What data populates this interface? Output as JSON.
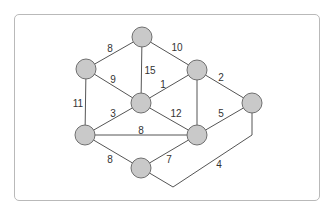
{
  "diagram": {
    "type": "weighted-undirected-graph",
    "node_style": {
      "fill": "#c9c9c9",
      "stroke": "#6f6f6f",
      "radius": 10
    },
    "nodes": [
      {
        "id": "top",
        "x": 142,
        "y": 37
      },
      {
        "id": "upper-left",
        "x": 86,
        "y": 69
      },
      {
        "id": "upper-right",
        "x": 197,
        "y": 70
      },
      {
        "id": "center",
        "x": 141,
        "y": 103
      },
      {
        "id": "far-right",
        "x": 252,
        "y": 103
      },
      {
        "id": "lower-left",
        "x": 85,
        "y": 135
      },
      {
        "id": "lower-right",
        "x": 197,
        "y": 135
      },
      {
        "id": "bottom",
        "x": 141,
        "y": 168
      }
    ],
    "edges": [
      {
        "from": "top",
        "to": "upper-left",
        "weight": "8"
      },
      {
        "from": "top",
        "to": "upper-right",
        "weight": "10"
      },
      {
        "from": "top",
        "to": "center",
        "weight": "15"
      },
      {
        "from": "upper-left",
        "to": "center",
        "weight": "9"
      },
      {
        "from": "upper-left",
        "to": "lower-left",
        "weight": "11"
      },
      {
        "from": "upper-right",
        "to": "center",
        "weight": "1"
      },
      {
        "from": "upper-right",
        "to": "far-right",
        "weight": "2"
      },
      {
        "from": "upper-right",
        "to": "lower-right",
        "weight": ""
      },
      {
        "from": "center",
        "to": "lower-left",
        "weight": "3"
      },
      {
        "from": "center",
        "to": "lower-right",
        "weight": "12"
      },
      {
        "from": "far-right",
        "to": "lower-right",
        "weight": "5"
      },
      {
        "from": "lower-left",
        "to": "lower-right",
        "weight": "8"
      },
      {
        "from": "lower-left",
        "to": "bottom",
        "weight": "8"
      },
      {
        "from": "lower-right",
        "to": "bottom",
        "weight": "7"
      },
      {
        "from": "bottom",
        "to": "far-right",
        "weight": "4",
        "routed": true
      }
    ],
    "labels": {
      "e_top_ul": "8",
      "e_top_ur": "10",
      "e_top_c": "15",
      "e_ul_c": "9",
      "e_ul_ll": "11",
      "e_ur_c": "1",
      "e_ur_fr": "2",
      "e_c_ll": "3",
      "e_c_lr": "12",
      "e_fr_lr": "5",
      "e_ll_lr": "8",
      "e_ll_b": "8",
      "e_lr_b": "7",
      "e_b_fr": "4"
    }
  }
}
